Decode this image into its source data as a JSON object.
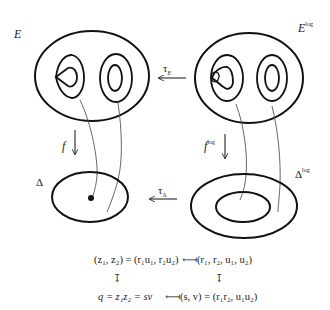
{
  "labels": {
    "E": "E",
    "E_log_base": "E",
    "E_log_sup": "log",
    "tau_E_base": "τ",
    "tau_E_sub": "E",
    "f": "f",
    "f_log_base": "f",
    "f_log_sup": "log",
    "Delta": "Δ",
    "Delta_log_base": "Δ",
    "Delta_log_sup": "log",
    "tau_Delta_base": "τ",
    "tau_Delta_sub": "Δ"
  },
  "formulas": {
    "row1_left": "(z₁, z₂) = (r₁u₁, r₂u₂)",
    "row1_arrow": "⟻",
    "row1_right": "(r₁, r₂, u₁, u₂)",
    "row2_left": "q = z₁z₂ = sv",
    "row2_arrow": "⟻",
    "row2_right": "(s, v) = (r₁r₂, u₁u₂)",
    "down_arrow": "↧"
  },
  "colors": {
    "stroke": "#111111",
    "thin_stroke": "#555555"
  }
}
